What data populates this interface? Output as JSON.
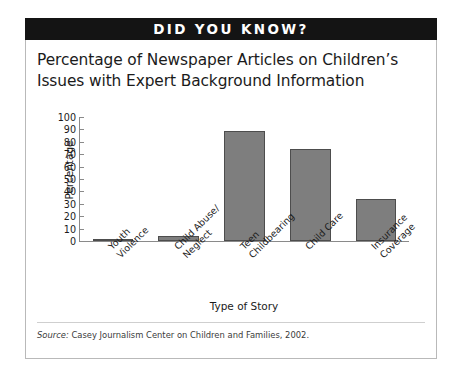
{
  "banner": {
    "text": "DID YOU KNOW?"
  },
  "figure": {
    "title_line1": "Percentage of Newspaper Articles on Children’s",
    "title_line2": "Issues with Expert Background Information",
    "source_prefix": "Source:",
    "source_text": "Casey Journalism Center on Children and Families, 2002."
  },
  "chart_data": {
    "type": "bar",
    "title": "Percentage of Newspaper Articles on Children’s Issues with Expert Background Information",
    "xlabel": "Type of Story",
    "ylabel": "Percentage",
    "categories": [
      "Youth Violence",
      "Child Abuse/ Neglect",
      "Teen Childbearing",
      "Child Care",
      "Insurance Coverage"
    ],
    "category_lines": [
      [
        "Youth",
        "Violence"
      ],
      [
        "Child Abuse/",
        "Neglect"
      ],
      [
        "Teen",
        "Childbearing"
      ],
      [
        "Child Care",
        ""
      ],
      [
        "Insurance",
        "Coverage"
      ]
    ],
    "values": [
      2,
      4,
      89,
      74,
      34
    ],
    "ylim": [
      0,
      100
    ],
    "yticks": [
      0,
      10,
      20,
      30,
      40,
      50,
      60,
      70,
      80,
      90,
      100
    ],
    "grid": false,
    "legend": "none",
    "bar_color": "#7e7e7e",
    "bar_edge_color": "#4d4d4d",
    "axis_color": "#8a8a8a"
  }
}
